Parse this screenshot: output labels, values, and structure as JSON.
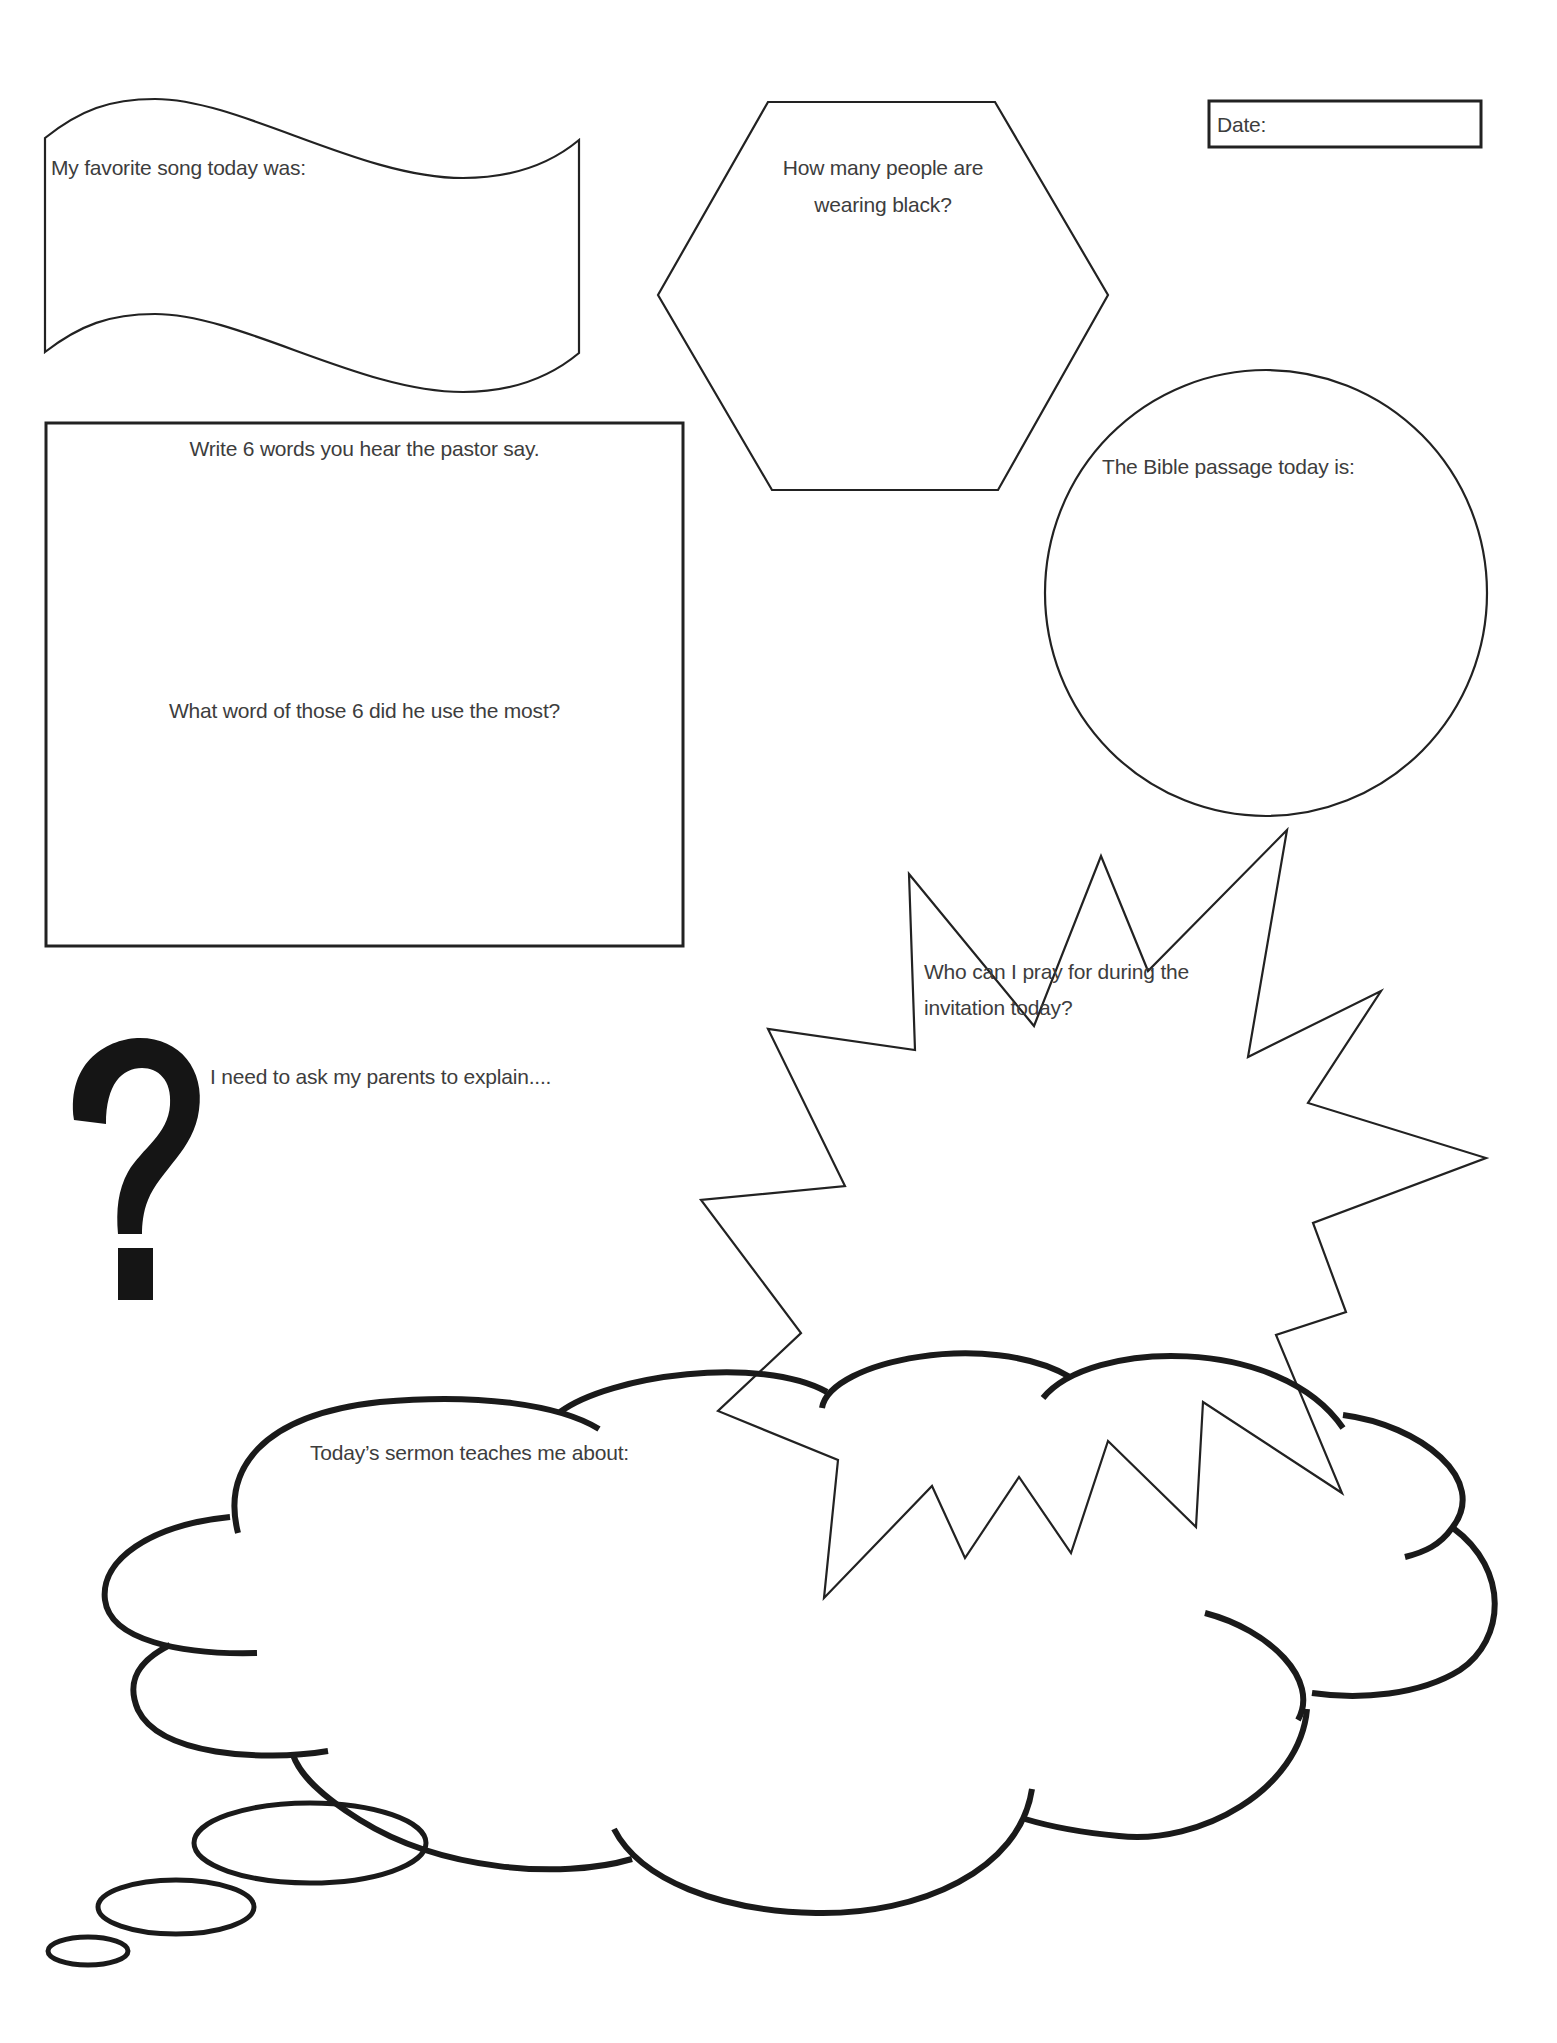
{
  "worksheet": {
    "date_box": {
      "label": "Date:"
    },
    "favorite_song": {
      "prompt": "My favorite song today was:",
      "shape": "wavy-flag"
    },
    "people_in_black": {
      "prompt_line1": "How many people are",
      "prompt_line2": "wearing black?",
      "shape": "hexagon"
    },
    "pastor_words": {
      "prompt": "Write 6 words you hear the pastor say.",
      "followup": "What word of those 6 did he use the most?",
      "shape": "rectangle"
    },
    "bible_passage": {
      "prompt": "The Bible passage today is:",
      "shape": "circle"
    },
    "prayer": {
      "prompt_line1": "Who can I pray for during the",
      "prompt_line2": "invitation today?",
      "shape": "starburst"
    },
    "ask_parents": {
      "prompt": "I need to ask my parents to explain....",
      "icon": "question-mark-icon"
    },
    "sermon": {
      "prompt": "Today’s sermon teaches me about:",
      "shape": "thought-cloud"
    }
  },
  "colors": {
    "outline": "#1a1a1a",
    "text": "#3d3d3d",
    "background": "#ffffff"
  }
}
